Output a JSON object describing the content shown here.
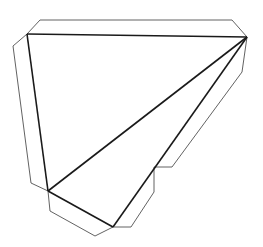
{
  "figure": {
    "width": 263,
    "height": 247,
    "colors": {
      "background": "#ffffff",
      "fold_line": "#1a1a1a",
      "cut_line": "#3a3a3a"
    },
    "vertices": {
      "A": [
        27,
        34
      ],
      "B": [
        247,
        37
      ],
      "C": [
        48,
        191
      ],
      "D": [
        113,
        227
      ],
      "E": [
        154,
        167
      ]
    },
    "fold_lines": [
      {
        "name": "edge-a-b",
        "points": "27,34 247,37"
      },
      {
        "name": "edge-a-c",
        "points": "27,34 48,191"
      },
      {
        "name": "edge-b-c",
        "points": "247,37 48,191"
      },
      {
        "name": "edge-c-d",
        "points": "48,191 113,227"
      },
      {
        "name": "edge-b-d",
        "points": "247,37 113,227"
      }
    ],
    "flaps": [
      {
        "name": "top-flap",
        "points": "27,34 40,20 232,20 247,37"
      },
      {
        "name": "left-flap",
        "points": "27,34 13,46 31,183 48,191"
      },
      {
        "name": "bottom-flap",
        "points": "48,191 50,211 95,236 113,227"
      },
      {
        "name": "right-flap",
        "points": "247,37 242,72 172,167 154,167"
      },
      {
        "name": "lower-right-flap",
        "points": "154,167 154,192 131,227 113,227"
      }
    ]
  }
}
